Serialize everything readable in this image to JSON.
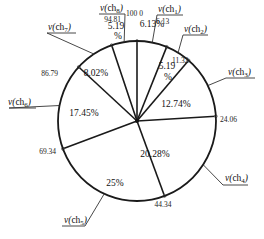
{
  "chart_data": {
    "type": "pie",
    "title": "",
    "start_angle_deg": 0,
    "direction": "clockwise",
    "cumulative_boundaries": [
      0,
      6.13,
      11.32,
      24.06,
      44.34,
      69.34,
      86.79,
      94.81,
      100
    ],
    "categories": [
      "v(ch1)",
      "v(ch2)",
      "v(ch3)",
      "v(ch4)",
      "v(ch5)",
      "v(ch6)",
      "v(ch7)",
      "v(ch8)"
    ],
    "values": [
      6.13,
      5.19,
      12.74,
      20.28,
      25,
      17.45,
      8.02,
      5.19
    ],
    "value_labels": [
      "6.13%",
      "5.19 %",
      "12.74%",
      "20.28%",
      "25%",
      "17.45%",
      "8.02%",
      "5.19 %"
    ],
    "boundary_labels": [
      "100 0",
      "6.13",
      "11.32",
      "24.06",
      "44.34",
      "69.34",
      "86.79",
      "94.81"
    ]
  },
  "colors": {
    "line": "#1a1a1a",
    "background": "#ffffff"
  }
}
